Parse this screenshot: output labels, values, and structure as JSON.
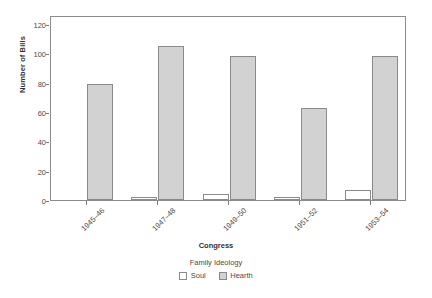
{
  "chart_data": {
    "type": "bar",
    "title": "",
    "xlabel": "Congress",
    "ylabel": "Number of Bills",
    "categories": [
      "1945–46",
      "1947–48",
      "1949–50",
      "1951–52",
      "1953–54"
    ],
    "series": [
      {
        "name": "Soul",
        "values": [
          0,
          2,
          4,
          2,
          7
        ],
        "color": "#ffffff"
      },
      {
        "name": "Hearth",
        "values": [
          79,
          105,
          98,
          63,
          98
        ],
        "color": "#d2d2d2"
      }
    ],
    "ylim": [
      0,
      126
    ],
    "yticks": [
      0,
      20,
      40,
      60,
      80,
      100,
      120
    ],
    "ytick_labels": [
      "0",
      "20",
      "40",
      "60",
      "80",
      "100",
      "120"
    ],
    "grid": false,
    "legend": {
      "title": "Family Ideology",
      "position": "bottom",
      "entries": [
        "Soul",
        "Hearth"
      ]
    },
    "axis_color": "#8c8c8c",
    "bar_edge_color": "#8a8a8a"
  }
}
